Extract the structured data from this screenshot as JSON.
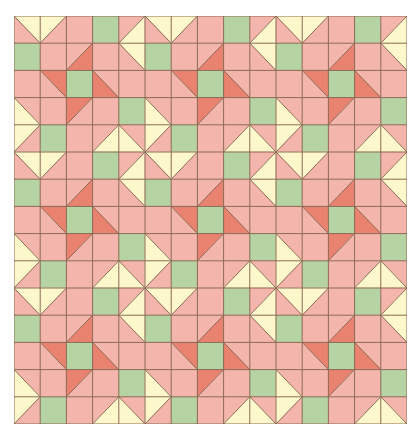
{
  "quilt": {
    "grid": {
      "block_rows": 3,
      "block_cols": 3,
      "cells_per_block": 5
    },
    "colors": {
      "pink": "#f4b6ac",
      "dark": "#e9826f",
      "green": "#b6d3a3",
      "yellow": "#fdf8cc",
      "line": "#8c6b55"
    },
    "block_cells": [
      [
        {
          "type": "split",
          "diag": "main",
          "upper": "yellow",
          "lower": "pink"
        },
        {
          "type": "split",
          "diag": "anti",
          "upper": "yellow",
          "lower": "pink"
        },
        {
          "type": "solid",
          "fill": "pink"
        },
        {
          "type": "solid",
          "fill": "green"
        },
        {
          "type": "split",
          "diag": "anti",
          "upper": "pink",
          "lower": "yellow"
        }
      ],
      [
        {
          "type": "solid",
          "fill": "green"
        },
        {
          "type": "solid",
          "fill": "pink"
        },
        {
          "type": "split",
          "diag": "anti",
          "upper": "pink",
          "lower": "dark"
        },
        {
          "type": "solid",
          "fill": "pink"
        },
        {
          "type": "split",
          "diag": "main",
          "upper": "yellow",
          "lower": "pink"
        }
      ],
      [
        {
          "type": "solid",
          "fill": "pink"
        },
        {
          "type": "split",
          "diag": "main",
          "upper": "dark",
          "lower": "pink"
        },
        {
          "type": "solid",
          "fill": "green"
        },
        {
          "type": "split",
          "diag": "main",
          "upper": "pink",
          "lower": "dark"
        },
        {
          "type": "solid",
          "fill": "pink"
        }
      ],
      [
        {
          "type": "split",
          "diag": "main",
          "upper": "pink",
          "lower": "yellow"
        },
        {
          "type": "solid",
          "fill": "pink"
        },
        {
          "type": "split",
          "diag": "anti",
          "upper": "dark",
          "lower": "pink"
        },
        {
          "type": "solid",
          "fill": "pink"
        },
        {
          "type": "solid",
          "fill": "green"
        }
      ],
      [
        {
          "type": "split",
          "diag": "anti",
          "upper": "yellow",
          "lower": "pink"
        },
        {
          "type": "solid",
          "fill": "green"
        },
        {
          "type": "solid",
          "fill": "pink"
        },
        {
          "type": "split",
          "diag": "anti",
          "upper": "pink",
          "lower": "yellow"
        },
        {
          "type": "split",
          "diag": "main",
          "upper": "pink",
          "lower": "yellow"
        }
      ]
    ]
  }
}
